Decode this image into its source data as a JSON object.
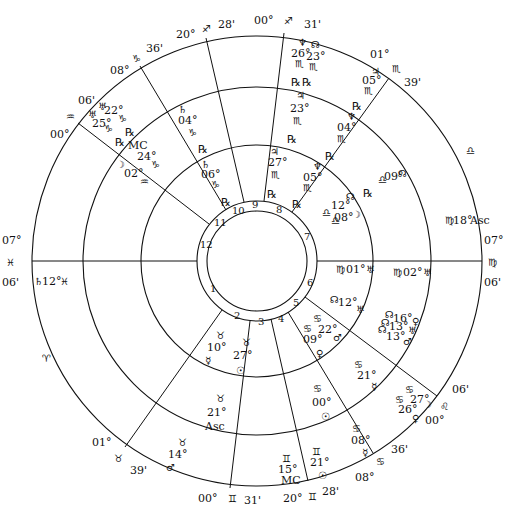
{
  "chart": {
    "center": [
      257,
      261
    ],
    "rings": {
      "outer": 225,
      "middle": 174,
      "inner": 116,
      "house_outer": 60,
      "house_inner": 50
    },
    "cusp_lines": [
      {
        "house": 1,
        "from": [
          32,
          261
        ],
        "to": [
          197,
          261
        ]
      },
      {
        "house": 2,
        "from": [
          125,
          447
        ],
        "to": [
          222,
          310
        ]
      },
      {
        "house": 3,
        "from": [
          230,
          488
        ],
        "to": [
          250,
          321
        ]
      },
      {
        "house": 4,
        "from": [
          308,
          481
        ],
        "to": [
          271,
          319
        ]
      },
      {
        "house": 5,
        "from": [
          373,
          453
        ],
        "to": [
          288,
          312
        ]
      },
      {
        "house": 6,
        "from": [
          437,
          396
        ],
        "to": [
          305,
          297
        ]
      },
      {
        "house": 7,
        "from": [
          482,
          261
        ],
        "to": [
          317,
          261
        ]
      },
      {
        "house": 8,
        "from": [
          389,
          78
        ],
        "to": [
          292,
          212
        ]
      },
      {
        "house": 9,
        "from": [
          284,
          33
        ],
        "to": [
          264,
          201
        ]
      },
      {
        "house": 10,
        "from": [
          206,
          38
        ],
        "to": [
          244,
          202
        ]
      },
      {
        "house": 11,
        "from": [
          140,
          66
        ],
        "to": [
          226,
          210
        ]
      },
      {
        "house": 12,
        "from": [
          78,
          123
        ],
        "to": [
          209,
          224
        ]
      }
    ],
    "house_numbers": [
      {
        "n": "1",
        "x": 210,
        "y": 292
      },
      {
        "n": "2",
        "x": 234,
        "y": 319
      },
      {
        "n": "3",
        "x": 258,
        "y": 325
      },
      {
        "n": "4",
        "x": 278,
        "y": 322
      },
      {
        "n": "5",
        "x": 293,
        "y": 306
      },
      {
        "n": "6",
        "x": 307,
        "y": 286
      },
      {
        "n": "7",
        "x": 304,
        "y": 240
      },
      {
        "n": "8",
        "x": 276,
        "y": 213
      },
      {
        "n": "9",
        "x": 252,
        "y": 208
      },
      {
        "n": "10",
        "x": 232,
        "y": 214
      },
      {
        "n": "11",
        "x": 214,
        "y": 226
      },
      {
        "n": "12",
        "x": 200,
        "y": 248
      }
    ],
    "cusp_labels": [
      {
        "text": "07°",
        "x": 2,
        "y": 244
      },
      {
        "text": "♓",
        "x": 6,
        "y": 266
      },
      {
        "text": "06'",
        "x": 2,
        "y": 286
      },
      {
        "text": "01°",
        "x": 92,
        "y": 446
      },
      {
        "text": "♉",
        "x": 114,
        "y": 462
      },
      {
        "text": "39'",
        "x": 130,
        "y": 474
      },
      {
        "text": "00°",
        "x": 198,
        "y": 502
      },
      {
        "text": "♊",
        "x": 228,
        "y": 502
      },
      {
        "text": "31'",
        "x": 244,
        "y": 504
      },
      {
        "text": "20°",
        "x": 283,
        "y": 502
      },
      {
        "text": "♊",
        "x": 308,
        "y": 500
      },
      {
        "text": "28'",
        "x": 322,
        "y": 495
      },
      {
        "text": "08°",
        "x": 355,
        "y": 481
      },
      {
        "text": "♋",
        "x": 376,
        "y": 465
      },
      {
        "text": "36'",
        "x": 391,
        "y": 453
      },
      {
        "text": "00°",
        "x": 425,
        "y": 424
      },
      {
        "text": "♌",
        "x": 440,
        "y": 410
      },
      {
        "text": "06'",
        "x": 452,
        "y": 393
      },
      {
        "text": "07°",
        "x": 484,
        "y": 244
      },
      {
        "text": "♍",
        "x": 488,
        "y": 266
      },
      {
        "text": "06'",
        "x": 484,
        "y": 286
      },
      {
        "text": "01°",
        "x": 370,
        "y": 58
      },
      {
        "text": "♏",
        "x": 392,
        "y": 72
      },
      {
        "text": "39'",
        "x": 404,
        "y": 86
      },
      {
        "text": "00°",
        "x": 254,
        "y": 24
      },
      {
        "text": "♐",
        "x": 284,
        "y": 24
      },
      {
        "text": "31'",
        "x": 304,
        "y": 28
      },
      {
        "text": "20°",
        "x": 176,
        "y": 38
      },
      {
        "text": "♐",
        "x": 202,
        "y": 32
      },
      {
        "text": "28'",
        "x": 218,
        "y": 28
      },
      {
        "text": "08°",
        "x": 110,
        "y": 74
      },
      {
        "text": "♑",
        "x": 132,
        "y": 62
      },
      {
        "text": "36'",
        "x": 146,
        "y": 52
      },
      {
        "text": "00°",
        "x": 50,
        "y": 138
      },
      {
        "text": "♒",
        "x": 66,
        "y": 120
      },
      {
        "text": "06'",
        "x": 78,
        "y": 104
      },
      {
        "text": "♈",
        "x": 42,
        "y": 362
      },
      {
        "text": "♎",
        "x": 466,
        "y": 154
      }
    ],
    "planets": [
      {
        "text": "♅",
        "x": 98,
        "y": 110
      },
      {
        "text": "22°",
        "x": 104,
        "y": 114
      },
      {
        "text": "♑",
        "x": 118,
        "y": 122
      },
      {
        "text": "♅",
        "x": 88,
        "y": 118
      },
      {
        "text": "25°",
        "x": 92,
        "y": 127
      },
      {
        "text": "♑",
        "x": 104,
        "y": 132
      },
      {
        "text": "℞",
        "x": 125,
        "y": 136
      },
      {
        "text": "℞",
        "x": 115,
        "y": 146
      },
      {
        "text": "MC",
        "x": 128,
        "y": 149
      },
      {
        "text": "24°",
        "x": 137,
        "y": 160
      },
      {
        "text": "♑",
        "x": 151,
        "y": 168
      },
      {
        "text": "☽",
        "x": 116,
        "y": 168
      },
      {
        "text": "02°",
        "x": 124,
        "y": 177
      },
      {
        "text": "♒",
        "x": 140,
        "y": 185
      },
      {
        "text": "♄",
        "x": 178,
        "y": 113
      },
      {
        "text": "04°",
        "x": 178,
        "y": 124
      },
      {
        "text": "♑",
        "x": 188,
        "y": 136
      },
      {
        "text": "℞",
        "x": 198,
        "y": 153
      },
      {
        "text": "♄",
        "x": 201,
        "y": 168
      },
      {
        "text": "06°",
        "x": 201,
        "y": 178
      },
      {
        "text": "♑",
        "x": 211,
        "y": 188
      },
      {
        "text": "℞",
        "x": 221,
        "y": 206
      },
      {
        "text": "♆",
        "x": 298,
        "y": 46
      },
      {
        "text": "26°",
        "x": 291,
        "y": 57
      },
      {
        "text": "♏",
        "x": 295,
        "y": 67
      },
      {
        "text": "☊",
        "x": 311,
        "y": 48
      },
      {
        "text": "23°",
        "x": 306,
        "y": 60
      },
      {
        "text": "♏",
        "x": 309,
        "y": 70
      },
      {
        "text": "♃",
        "x": 371,
        "y": 75
      },
      {
        "text": "05°",
        "x": 362,
        "y": 84
      },
      {
        "text": "♏",
        "x": 364,
        "y": 94
      },
      {
        "text": "℞",
        "x": 291,
        "y": 86
      },
      {
        "text": "℞",
        "x": 302,
        "y": 86
      },
      {
        "text": "♃",
        "x": 296,
        "y": 99
      },
      {
        "text": "23°",
        "x": 290,
        "y": 112
      },
      {
        "text": "♏",
        "x": 293,
        "y": 124
      },
      {
        "text": "℞",
        "x": 352,
        "y": 110
      },
      {
        "text": "♆",
        "x": 347,
        "y": 120
      },
      {
        "text": "04°",
        "x": 337,
        "y": 131
      },
      {
        "text": "♏",
        "x": 337,
        "y": 142
      },
      {
        "text": "℞",
        "x": 287,
        "y": 143
      },
      {
        "text": "♃",
        "x": 270,
        "y": 155
      },
      {
        "text": "27°",
        "x": 268,
        "y": 166
      },
      {
        "text": "♏",
        "x": 271,
        "y": 178
      },
      {
        "text": "℞",
        "x": 325,
        "y": 160
      },
      {
        "text": "♆",
        "x": 313,
        "y": 170
      },
      {
        "text": "05°",
        "x": 303,
        "y": 181
      },
      {
        "text": "♏",
        "x": 303,
        "y": 191
      },
      {
        "text": "℞",
        "x": 267,
        "y": 198
      },
      {
        "text": "℞",
        "x": 292,
        "y": 208
      },
      {
        "text": "☊",
        "x": 346,
        "y": 200
      },
      {
        "text": "℞",
        "x": 363,
        "y": 197
      },
      {
        "text": "12°",
        "x": 331,
        "y": 209
      },
      {
        "text": "♎",
        "x": 322,
        "y": 216
      },
      {
        "text": "08°",
        "x": 334,
        "y": 221
      },
      {
        "text": "☽",
        "x": 352,
        "y": 218
      },
      {
        "text": "♎",
        "x": 331,
        "y": 224
      },
      {
        "text": "♎",
        "x": 378,
        "y": 183
      },
      {
        "text": "09°",
        "x": 384,
        "y": 180
      },
      {
        "text": "☊",
        "x": 398,
        "y": 177
      },
      {
        "text": "♍",
        "x": 445,
        "y": 224
      },
      {
        "text": "18°",
        "x": 453,
        "y": 224
      },
      {
        "text": "Asc",
        "x": 470,
        "y": 224
      },
      {
        "text": "♄",
        "x": 34,
        "y": 285
      },
      {
        "text": "12°",
        "x": 42,
        "y": 285
      },
      {
        "text": "♓",
        "x": 60,
        "y": 285
      },
      {
        "text": "♍",
        "x": 336,
        "y": 273
      },
      {
        "text": "01°",
        "x": 346,
        "y": 273
      },
      {
        "text": "♅",
        "x": 366,
        "y": 273
      },
      {
        "text": "♍",
        "x": 393,
        "y": 276
      },
      {
        "text": "02°",
        "x": 403,
        "y": 276
      },
      {
        "text": "♅",
        "x": 423,
        "y": 276
      },
      {
        "text": "☊",
        "x": 330,
        "y": 303
      },
      {
        "text": "12°",
        "x": 338,
        "y": 306
      },
      {
        "text": "♅",
        "x": 356,
        "y": 313
      },
      {
        "text": "☊",
        "x": 385,
        "y": 318
      },
      {
        "text": "16°",
        "x": 393,
        "y": 322
      },
      {
        "text": "♀",
        "x": 412,
        "y": 325
      },
      {
        "text": "☊",
        "x": 381,
        "y": 326
      },
      {
        "text": "13°",
        "x": 389,
        "y": 330
      },
      {
        "text": "♅",
        "x": 408,
        "y": 334
      },
      {
        "text": "☊",
        "x": 378,
        "y": 333
      },
      {
        "text": "13°",
        "x": 386,
        "y": 340
      },
      {
        "text": "♂",
        "x": 403,
        "y": 345
      },
      {
        "text": "♋",
        "x": 313,
        "y": 322
      },
      {
        "text": "22°",
        "x": 318,
        "y": 333
      },
      {
        "text": "♋",
        "x": 303,
        "y": 332
      },
      {
        "text": "09°",
        "x": 303,
        "y": 343
      },
      {
        "text": "♂",
        "x": 333,
        "y": 341
      },
      {
        "text": "♀",
        "x": 316,
        "y": 357
      },
      {
        "text": "♋",
        "x": 354,
        "y": 368
      },
      {
        "text": "21°",
        "x": 357,
        "y": 379
      },
      {
        "text": "☿",
        "x": 371,
        "y": 390
      },
      {
        "text": "♋",
        "x": 405,
        "y": 393
      },
      {
        "text": "27°",
        "x": 410,
        "y": 403
      },
      {
        "text": "♋",
        "x": 395,
        "y": 403
      },
      {
        "text": "26°",
        "x": 398,
        "y": 413
      },
      {
        "text": "☽",
        "x": 423,
        "y": 408
      },
      {
        "text": "♀",
        "x": 412,
        "y": 422
      },
      {
        "text": "♋",
        "x": 313,
        "y": 392
      },
      {
        "text": "00°",
        "x": 312,
        "y": 406
      },
      {
        "text": "☉",
        "x": 321,
        "y": 420
      },
      {
        "text": "♋",
        "x": 352,
        "y": 432
      },
      {
        "text": "08°",
        "x": 351,
        "y": 444
      },
      {
        "text": "☿",
        "x": 362,
        "y": 456
      },
      {
        "text": "♊",
        "x": 312,
        "y": 455
      },
      {
        "text": "21°",
        "x": 310,
        "y": 466
      },
      {
        "text": "☉",
        "x": 318,
        "y": 479
      },
      {
        "text": "♊",
        "x": 282,
        "y": 462
      },
      {
        "text": "15°",
        "x": 278,
        "y": 473
      },
      {
        "text": "MC",
        "x": 281,
        "y": 484
      },
      {
        "text": "♉",
        "x": 216,
        "y": 339
      },
      {
        "text": "10°",
        "x": 207,
        "y": 351
      },
      {
        "text": "☿",
        "x": 205,
        "y": 364
      },
      {
        "text": "♉",
        "x": 242,
        "y": 346
      },
      {
        "text": "27°",
        "x": 233,
        "y": 359
      },
      {
        "text": "☉",
        "x": 236,
        "y": 374
      },
      {
        "text": "♉",
        "x": 216,
        "y": 402
      },
      {
        "text": "21°",
        "x": 207,
        "y": 416
      },
      {
        "text": "Asc",
        "x": 205,
        "y": 430
      },
      {
        "text": "♉",
        "x": 178,
        "y": 446
      },
      {
        "text": "14°",
        "x": 168,
        "y": 458
      },
      {
        "text": "♂",
        "x": 166,
        "y": 471
      }
    ]
  }
}
